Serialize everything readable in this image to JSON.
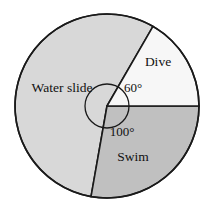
{
  "figure": {
    "name": "pie-chart-water-park-activities",
    "background_color": "#ffffff"
  },
  "chart_data": {
    "type": "pie",
    "title": "",
    "subtitle": "",
    "xlabel": "",
    "ylabel": "",
    "legend_position": "none",
    "grid": false,
    "units": "degrees",
    "total_degrees": 360,
    "center": {
      "x": 107,
      "y": 106
    },
    "radius": 92,
    "outline_color": "#1a1a1a",
    "outline_width": 1.6,
    "angle_arc_radius": 22,
    "labels_shown": [
      "Water slide",
      "Dive",
      "Swim"
    ],
    "angle_labels_shown": [
      "60°",
      "100°"
    ],
    "categories": [
      "Dive",
      "Swim",
      "Water slide"
    ],
    "values": [
      60,
      100,
      200
    ],
    "slices": [
      {
        "label": "Dive",
        "value": 60,
        "angle_text": "60°",
        "angle_text_shown": true,
        "color": "#f7f7f7",
        "start_angle": 0,
        "end_angle": 60,
        "label_x": 158,
        "label_y": 66,
        "angle_label_x": 133,
        "angle_label_y": 92
      },
      {
        "label": "Swim",
        "value": 100,
        "angle_text": "100°",
        "angle_text_shown": true,
        "color": "#c0c0c0",
        "start_angle": 260,
        "end_angle": 360,
        "label_x": 133,
        "label_y": 161,
        "angle_label_x": 122,
        "angle_label_y": 136
      },
      {
        "label": "Water slide",
        "value": 200,
        "angle_text": "",
        "angle_text_shown": false,
        "color": "#d8d8d8",
        "start_angle": 60,
        "end_angle": 260,
        "label_x": 62,
        "label_y": 92,
        "angle_label_x": 0,
        "angle_label_y": 0
      }
    ]
  }
}
